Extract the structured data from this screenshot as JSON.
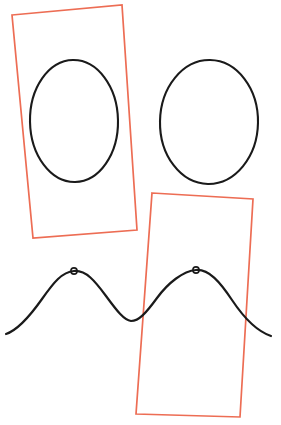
{
  "canvas": {
    "width": 281,
    "height": 425,
    "background_color": "#ffffff",
    "title": "Shapes Annotation Canvas"
  },
  "palette": {
    "stroke_black": "#1a1a1a",
    "stroke_red": "#ed6d54",
    "fill_none": "none"
  },
  "shapes": {
    "ellipses": [
      {
        "name": "ellipse-left",
        "cx": 74,
        "cy": 121,
        "rx": 44,
        "ry": 61,
        "rotation": -1,
        "stroke": "#1a1a1a",
        "stroke_width": 2.1,
        "fill": "none"
      },
      {
        "name": "ellipse-right",
        "cx": 209,
        "cy": 122,
        "rx": 49,
        "ry": 62,
        "rotation": 1,
        "stroke": "#1a1a1a",
        "stroke_width": 2.1,
        "fill": "none"
      }
    ],
    "rectangles": [
      {
        "name": "rectangle-upper-left",
        "corners": [
          [
            12,
            15
          ],
          [
            122,
            5
          ],
          [
            137,
            230
          ],
          [
            33,
            238
          ]
        ],
        "rotation_deg": -5.2,
        "stroke": "#ed6d54",
        "stroke_width": 1.7,
        "fill": "none"
      },
      {
        "name": "rectangle-lower-right",
        "corners": [
          [
            152,
            193
          ],
          [
            253,
            199
          ],
          [
            240,
            417
          ],
          [
            136,
            414
          ]
        ],
        "rotation_deg": 3.4,
        "stroke": "#ed6d54",
        "stroke_width": 1.7,
        "fill": "none"
      }
    ],
    "wave": {
      "name": "sine-wave-curve",
      "stroke": "#1a1a1a",
      "stroke_width": 2.2,
      "fill": "none",
      "path": "M 6 334 C 18 330 30 316 42 299 C 54 282 62 272 74 271 C 86 270 95 281 106 296 C 117 311 124 320 131 321 C 139 321 146 313 157 298 C 168 283 183 271 196 270 C 209 269 220 282 232 300 C 244 318 256 331 271 336",
      "peaks": [
        {
          "name": "wave-peak-marker-left",
          "cx": 74,
          "cy": 271,
          "r": 3.1
        },
        {
          "name": "wave-peak-marker-right",
          "cx": 196,
          "cy": 270,
          "r": 3.1
        }
      ],
      "x_start": 6,
      "x_end": 271,
      "trough_x": 131,
      "trough_y": 321
    }
  }
}
